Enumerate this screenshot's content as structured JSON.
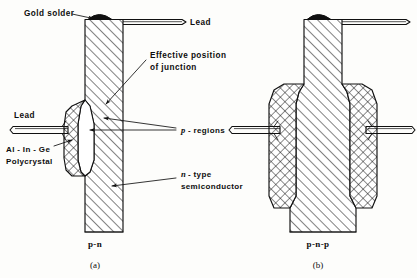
{
  "figure": {
    "background_color": "#fdfdfb",
    "ink_color": "#101010",
    "panels": [
      {
        "id": "a",
        "caption_letter": "(a)",
        "structure_label": "p-n",
        "description": "Single alloyed p-region on an n-type semiconductor wafer"
      },
      {
        "id": "b",
        "caption_letter": "(b)",
        "structure_label": "p-n-p",
        "description": "Two opposing alloyed p-regions on an n-type semiconductor wafer"
      }
    ]
  },
  "labels": {
    "gold_solder": "Gold solder",
    "lead_top": "Lead",
    "effective_position_line1": "Effective position",
    "effective_position_line2": "of junction",
    "lead_side": "Lead",
    "alloy_line1": "Al - In - Ge",
    "alloy_line2": "Polycrystal",
    "p_regions": "p - regions",
    "p_regions_italic_part": "p",
    "p_regions_rest": "- regions",
    "n_type_line1": "n - type",
    "n_type_line2": "semiconductor",
    "n_type_italic_part": "n",
    "n_type_rest": "- type"
  },
  "captions": {
    "panel_a_structure": "p-n",
    "panel_a_letter": "(a)",
    "panel_b_structure": "p-n-p",
    "panel_b_letter": "(b)"
  },
  "legend_materials": [
    {
      "name": "n-type semiconductor",
      "hatch": "diagonal-lines",
      "color": "#101010"
    },
    {
      "name": "Al-In-Ge polycrystal (p-region)",
      "hatch": "cross-hatch-diamond",
      "color": "#101010"
    },
    {
      "name": "Gold solder",
      "hatch": "solid-fill",
      "color": "#101010"
    },
    {
      "name": "Effective junction region",
      "hatch": "none-white",
      "color": "#ffffff"
    }
  ]
}
